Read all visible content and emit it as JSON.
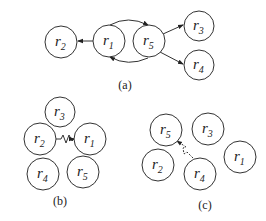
{
  "diagrams": [
    {
      "caption": "(a)",
      "nodes": [
        {
          "id": "r2",
          "base": "r",
          "sub": "2"
        },
        {
          "id": "r1",
          "base": "r",
          "sub": "1"
        },
        {
          "id": "r5",
          "base": "r",
          "sub": "5"
        },
        {
          "id": "r3",
          "base": "r",
          "sub": "3"
        },
        {
          "id": "r4",
          "base": "r",
          "sub": "4"
        }
      ],
      "edges": [
        {
          "from": "r1",
          "to": "r2",
          "type": "arrow"
        },
        {
          "from": "r1",
          "to": "r5",
          "type": "curved-arrow-top"
        },
        {
          "from": "r5",
          "to": "r1",
          "type": "curved-arrow-bottom"
        },
        {
          "from": "r5",
          "to": "r3",
          "type": "arrow"
        },
        {
          "from": "r5",
          "to": "r4",
          "type": "arrow"
        }
      ]
    },
    {
      "caption": "(b)",
      "nodes": [
        {
          "id": "r3",
          "base": "r",
          "sub": "3"
        },
        {
          "id": "r2",
          "base": "r",
          "sub": "2"
        },
        {
          "id": "r1",
          "base": "r",
          "sub": "1"
        },
        {
          "id": "r4",
          "base": "r",
          "sub": "4"
        },
        {
          "id": "r5",
          "base": "r",
          "sub": "5"
        }
      ],
      "edges": [
        {
          "from": "r2",
          "to": "r1",
          "type": "zigzag-arrow"
        }
      ]
    },
    {
      "caption": "(c)",
      "nodes": [
        {
          "id": "r5",
          "base": "r",
          "sub": "5"
        },
        {
          "id": "r3",
          "base": "r",
          "sub": "3"
        },
        {
          "id": "r2",
          "base": "r",
          "sub": "2"
        },
        {
          "id": "r4",
          "base": "r",
          "sub": "4"
        },
        {
          "id": "r1",
          "base": "r",
          "sub": "1"
        }
      ],
      "edges": [
        {
          "from": "r4",
          "to": "r5",
          "type": "dashed-zigzag-arrow"
        }
      ]
    }
  ]
}
